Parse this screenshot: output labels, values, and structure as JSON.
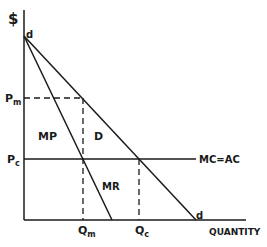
{
  "diagram": {
    "y_axis_label": "$",
    "x_axis_label": "QUANTITY",
    "price_labels": {
      "monopoly": "Pm",
      "competitive": "Pc"
    },
    "quantity_labels": {
      "monopoly": "Qm",
      "competitive": "Qc"
    },
    "curves": {
      "demand_label": "D",
      "demand_endpoint_label": "d",
      "demand_origin_label": "d",
      "marginal_revenue_label": "MR",
      "cost_label": "MC=AC"
    },
    "regions": {
      "monopoly_profit_label": "MP"
    },
    "colors": {
      "line": "#1a1a1a",
      "background": "#ffffff"
    }
  }
}
